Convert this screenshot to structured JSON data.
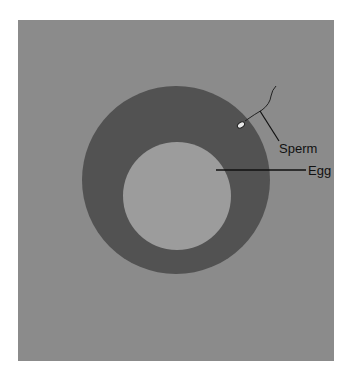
{
  "diagram": {
    "background_color": "#8b8b8b",
    "ring_color": "#525252",
    "inner_color": "#9c9c9c",
    "labels": {
      "sperm": "Sperm",
      "egg": "Egg"
    }
  }
}
